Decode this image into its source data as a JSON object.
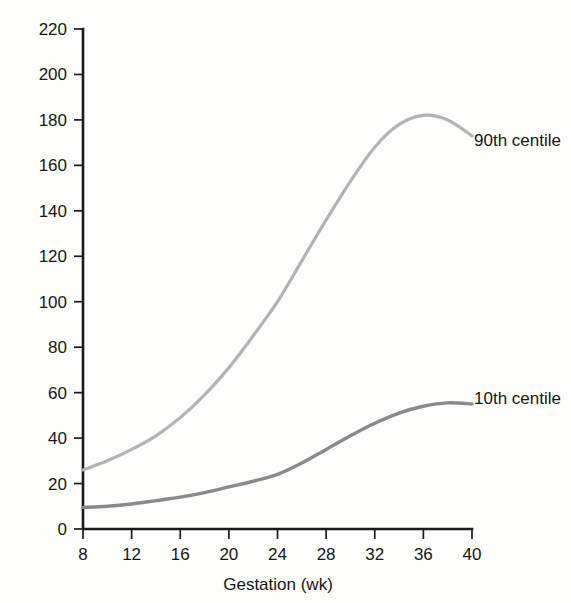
{
  "chart_data": {
    "type": "line",
    "title": "",
    "xlabel": "Gestation (wk)",
    "ylabel": "Prolactin (µg/L)",
    "xlim": [
      8,
      40
    ],
    "ylim": [
      0,
      220
    ],
    "xticks": [
      8,
      12,
      16,
      20,
      24,
      28,
      32,
      36,
      40
    ],
    "yticks": [
      0,
      20,
      40,
      60,
      80,
      100,
      120,
      140,
      160,
      180,
      200,
      220
    ],
    "grid": false,
    "legend_position": "inline-right-of-curve",
    "x": [
      8,
      10,
      12,
      14,
      16,
      18,
      20,
      22,
      24,
      26,
      28,
      30,
      32,
      34,
      36,
      38,
      40
    ],
    "series": [
      {
        "name": "90th centile",
        "color": "#b3b3b3",
        "linewidth": 3.2,
        "values": [
          26,
          30,
          35,
          41,
          49,
          59,
          71,
          85,
          100,
          118,
          136,
          153,
          168,
          178,
          182,
          180,
          173
        ]
      },
      {
        "name": "10th centile",
        "color": "#8a8a8a",
        "linewidth": 3.4,
        "values": [
          9.5,
          10,
          11,
          12.5,
          14,
          16,
          18.5,
          21,
          24,
          29,
          35,
          41,
          46.5,
          51,
          54,
          55.5,
          55
        ]
      }
    ],
    "annotations": [
      {
        "text": "90th centile",
        "x_px": 474,
        "y_px": 146
      },
      {
        "text": "10th centile",
        "x_px": 474,
        "y_px": 404
      }
    ]
  },
  "axes": {
    "y_title": "Prolactin (µg/L)",
    "x_title": "Gestation (wk)",
    "y_tick_labels": [
      "220",
      "200",
      "180",
      "160",
      "140",
      "120",
      "100",
      "80",
      "60",
      "40",
      "20",
      "0"
    ],
    "x_tick_labels": [
      "8",
      "12",
      "16",
      "20",
      "24",
      "28",
      "32",
      "36",
      "40"
    ]
  },
  "legend": {
    "upper_label": "90th centile",
    "lower_label": "10th centile"
  },
  "colors": {
    "background": "#fdfdfc",
    "axis": "#1a1a1a",
    "text": "#161616",
    "series_90th": "#b3b3b3",
    "series_10th": "#8a8a8a"
  }
}
